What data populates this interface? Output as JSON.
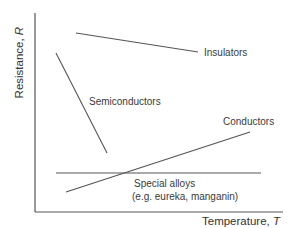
{
  "diagram": {
    "type": "line",
    "title": "",
    "axes": {
      "x_label": "Temperature, ",
      "x_label_var": "T",
      "y_label": "Resistance, ",
      "y_label_var": "R"
    },
    "series": [
      {
        "name": "Insulators",
        "trend": "decreasing slowly",
        "from": [
          0.19,
          0.93
        ],
        "to": [
          0.74,
          0.78
        ]
      },
      {
        "name": "Semiconductors",
        "trend": "decreasing steeply",
        "from": [
          0.09,
          0.75
        ],
        "to": [
          0.29,
          0.23
        ]
      },
      {
        "name": "Conductors",
        "trend": "increasing",
        "from": [
          0.13,
          0.07
        ],
        "to": [
          0.95,
          0.46
        ]
      },
      {
        "name": "Special alloys",
        "subtitle": "(e.g. eureka, manganin)",
        "trend": "constant",
        "from": [
          0.08,
          0.18
        ],
        "to": [
          0.99,
          0.18
        ]
      }
    ],
    "labels": {
      "insulators": "Insulators",
      "semiconductors": "Semiconductors",
      "conductors": "Conductors",
      "special_alloys_line1": "Special alloys",
      "special_alloys_line2": "(e.g. eureka, manganin)"
    },
    "line_color": "#555555"
  }
}
